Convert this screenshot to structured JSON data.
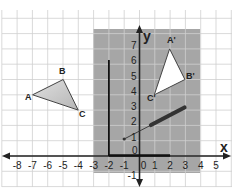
{
  "diagram": {
    "type": "coordinate-grid-transformation",
    "axes": {
      "x_label": "x",
      "y_label": "y",
      "x_ticks": [
        "-8",
        "-7",
        "-6",
        "-5",
        "-4",
        "-3",
        "-2",
        "-1",
        "0",
        "1",
        "2",
        "3",
        "4",
        "5"
      ],
      "y_ticks": [
        "-1",
        "0",
        "1",
        "2",
        "3",
        "4",
        "5",
        "6",
        "7"
      ]
    },
    "shaded_region": {
      "x_from": -3,
      "x_to": 4,
      "y_from": -1,
      "y_to": 8,
      "color": "#a6a6a6"
    },
    "triangle_original": {
      "labels": [
        "A",
        "B",
        "C"
      ],
      "points": [
        [
          -7,
          4
        ],
        [
          -5,
          5
        ],
        [
          -4,
          3
        ]
      ],
      "fill": "#c8c8c8"
    },
    "triangle_image": {
      "labels": [
        "A'",
        "B'",
        "C'"
      ],
      "points": [
        [
          2,
          7
        ],
        [
          3,
          5
        ],
        [
          1,
          4
        ]
      ],
      "fill": "#ffffff"
    },
    "mirror_line_vertical": {
      "x": -2,
      "y_from": 0,
      "y_to": 6
    },
    "mirror_line_horizontal": {
      "y": 0,
      "x_from": -2,
      "x_to": 2
    },
    "pointer_segment": {
      "start": [
        -1,
        1.1
      ],
      "bar_start": [
        0.7,
        2
      ],
      "bar_end": [
        3,
        3.2
      ]
    },
    "colors": {
      "grid": "#c9c9c9",
      "axis": "#222222",
      "shade": "#a6a6a6"
    }
  }
}
